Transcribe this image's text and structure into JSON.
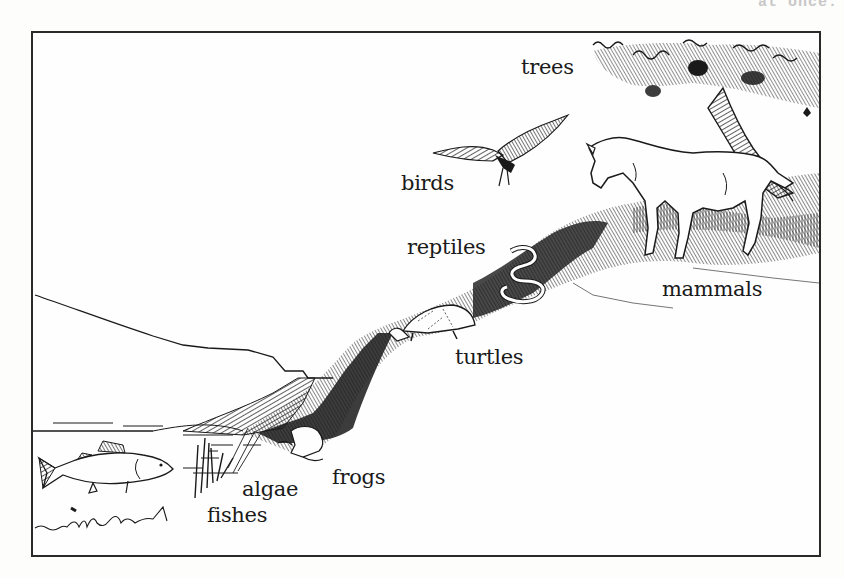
{
  "page": {
    "header_fragment": "at once."
  },
  "figure": {
    "labels": {
      "trees": "trees",
      "birds": "birds",
      "reptiles": "reptiles",
      "mammals": "mammals",
      "turtles": "turtles",
      "frogs": "frogs",
      "algae": "algae",
      "fishes": "fishes"
    },
    "colors": {
      "ink": "#1a1a1a",
      "paper": "#fefefe",
      "frame": "#2a2a2a"
    }
  }
}
